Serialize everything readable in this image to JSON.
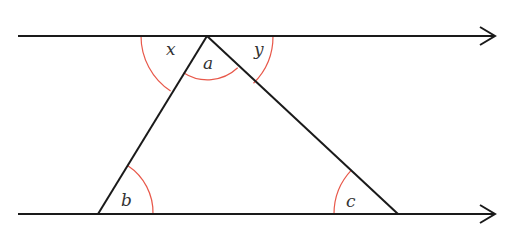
{
  "diagram": {
    "type": "parallel-lines-triangle",
    "colors": {
      "line": "#1a1a1a",
      "arc": "#e8584a",
      "label": "#333333",
      "background": "#ffffff"
    },
    "labels": {
      "x": "x",
      "a": "a",
      "y": "y",
      "b": "b",
      "c": "c"
    },
    "lines": [
      {
        "name": "top-parallel-line",
        "from": [
          18,
          36
        ],
        "to": [
          495,
          36
        ],
        "arrow": "right"
      },
      {
        "name": "bottom-parallel-line",
        "from": [
          18,
          214
        ],
        "to": [
          495,
          214
        ],
        "arrow": "right"
      }
    ],
    "triangle": {
      "apex": [
        207,
        36
      ],
      "bottom_left": [
        98,
        214
      ],
      "bottom_right": [
        398,
        214
      ]
    },
    "angles": [
      {
        "label": "x",
        "vertex": "apex",
        "position": "left of triangle on top line"
      },
      {
        "label": "a",
        "vertex": "apex",
        "position": "interior of triangle at apex"
      },
      {
        "label": "y",
        "vertex": "apex",
        "position": "right of triangle on top line"
      },
      {
        "label": "b",
        "vertex": "bottom_left",
        "position": "interior angle"
      },
      {
        "label": "c",
        "vertex": "bottom_right",
        "position": "interior angle"
      }
    ]
  }
}
